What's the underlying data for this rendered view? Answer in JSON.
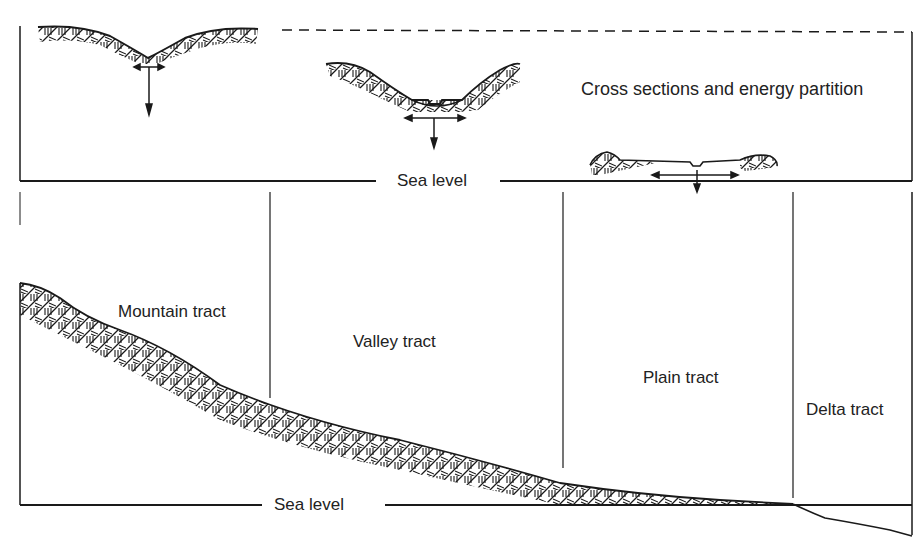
{
  "diagram": {
    "title": "Cross sections and energy partition",
    "top_panel": {
      "sea_level_label": "Sea level",
      "cross_sections": [
        {
          "name": "mountain-cross-section",
          "arrows": [
            "lateral",
            "downward"
          ]
        },
        {
          "name": "valley-cross-section",
          "arrows": [
            "lateral",
            "downward"
          ]
        },
        {
          "name": "plain-cross-section",
          "arrows": [
            "lateral",
            "downward"
          ]
        }
      ]
    },
    "bottom_panel": {
      "sea_level_label": "Sea level",
      "tracts": [
        {
          "label": "Mountain tract"
        },
        {
          "label": "Valley tract"
        },
        {
          "label": "Plain tract"
        },
        {
          "label": "Delta tract"
        }
      ]
    },
    "colors": {
      "ink": "#1a1a1a",
      "background": "#ffffff"
    }
  }
}
